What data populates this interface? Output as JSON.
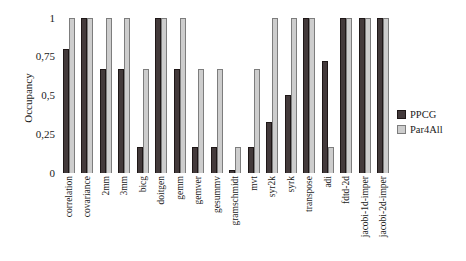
{
  "figure": {
    "background": "#ffffff"
  },
  "chart_data": {
    "type": "bar",
    "title": "",
    "xlabel": "",
    "ylabel": "Occupancy",
    "ylim": [
      0,
      1
    ],
    "grid": false,
    "legend_position": "right",
    "decimal_separator": ",",
    "yticks": [
      {
        "value": 0,
        "label": "0"
      },
      {
        "value": 0.25,
        "label": "0,25"
      },
      {
        "value": 0.5,
        "label": "0,5"
      },
      {
        "value": 0.75,
        "label": "0,75"
      },
      {
        "value": 1,
        "label": "1"
      }
    ],
    "categories": [
      "correlation",
      "covariance",
      "2mm",
      "3mm",
      "bicg",
      "doitgen",
      "gemm",
      "gemver",
      "gesummv",
      "gramschmidt",
      "mvt",
      "syr2k",
      "syrk",
      "transpose",
      "adi",
      "fdtd-2d",
      "jacobi-1d-imper",
      "jacobi-2d-imper"
    ],
    "series": [
      {
        "name": "PPCG",
        "color": "#433a3b",
        "border_color": "#1e1717",
        "values": [
          0.8,
          1,
          0.67,
          0.67,
          0.17,
          1,
          0.67,
          0.17,
          0.17,
          0.02,
          0.17,
          0.33,
          0.5,
          1,
          0.72,
          1,
          1,
          1
        ]
      },
      {
        "name": "Par4All",
        "color": "#cdcdcd",
        "border_color": "#7d7d7d",
        "values": [
          1,
          1,
          1,
          1,
          0.67,
          1,
          1,
          0.67,
          0.67,
          0.17,
          0.67,
          1,
          1,
          1,
          0.17,
          1,
          1,
          1
        ]
      }
    ]
  }
}
